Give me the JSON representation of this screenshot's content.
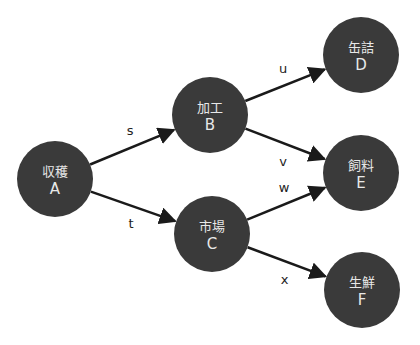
{
  "colors": {
    "node_fill": "#3a3a3a",
    "node_text": "#e8e8e8",
    "edge": "#1a1a1a",
    "background": "#ffffff"
  },
  "nodes": [
    {
      "id": "A",
      "name": "収穫",
      "cx": 55,
      "cy": 179,
      "r": 38
    },
    {
      "id": "B",
      "name": "加工",
      "cx": 210,
      "cy": 115,
      "r": 38
    },
    {
      "id": "C",
      "name": "市場",
      "cx": 212,
      "cy": 234,
      "r": 38
    },
    {
      "id": "D",
      "name": "缶詰",
      "cx": 361,
      "cy": 55,
      "r": 38
    },
    {
      "id": "E",
      "name": "飼料",
      "cx": 361,
      "cy": 173,
      "r": 38
    },
    {
      "id": "F",
      "name": "生鮮",
      "cx": 362,
      "cy": 290,
      "r": 38
    }
  ],
  "edges": [
    {
      "label": "s",
      "from": "A",
      "to": "B"
    },
    {
      "label": "t",
      "from": "A",
      "to": "C"
    },
    {
      "label": "u",
      "from": "B",
      "to": "D"
    },
    {
      "label": "v",
      "from": "B",
      "to": "E"
    },
    {
      "label": "w",
      "from": "C",
      "to": "E"
    },
    {
      "label": "x",
      "from": "C",
      "to": "F"
    }
  ]
}
